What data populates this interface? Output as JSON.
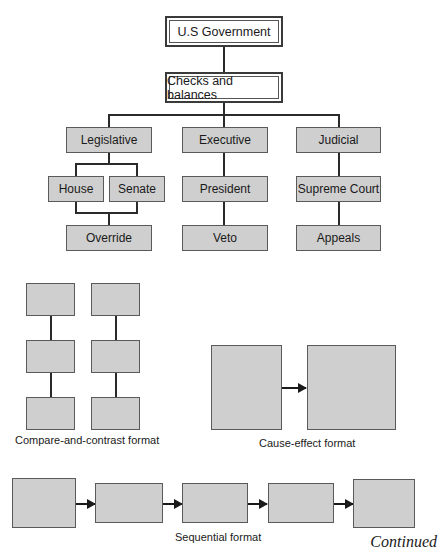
{
  "org_chart": {
    "root": "U.S Government",
    "level1": "Checks and balances",
    "branches": [
      {
        "name": "Legislative",
        "children": [
          "House",
          "Senate"
        ],
        "outcome": "Override"
      },
      {
        "name": "Executive",
        "children": [
          "President"
        ],
        "outcome": "Veto"
      },
      {
        "name": "Judicial",
        "children": [
          "Supreme Court"
        ],
        "outcome": "Appeals"
      }
    ]
  },
  "formats": {
    "compare_contrast": "Compare-and-contrast format",
    "cause_effect": "Cause-effect format",
    "sequential": "Sequential format"
  },
  "footer": {
    "continued": "Continued"
  }
}
